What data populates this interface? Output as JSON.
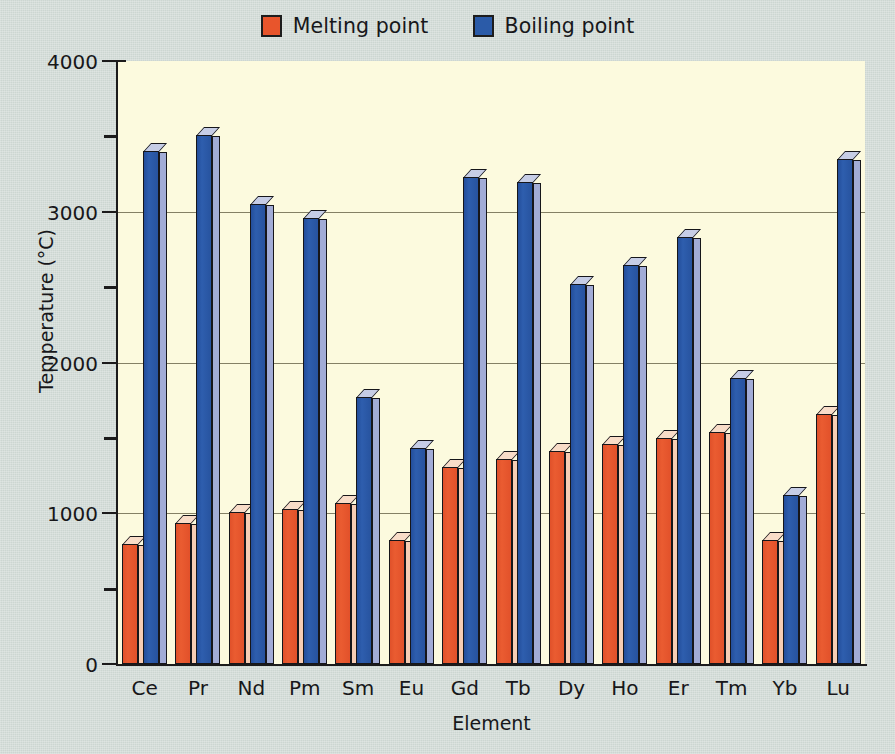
{
  "legend": {
    "entries": [
      {
        "label": "Melting point",
        "color": "#e8552c",
        "icon": "square-swatch-icon"
      },
      {
        "label": "Boiling point",
        "color": "#2b5ba8",
        "icon": "square-swatch-icon"
      }
    ]
  },
  "axes": {
    "ylabel": "Temperature (°C)",
    "xlabel": "Element",
    "ytick_labels": [
      "0",
      "1000",
      "2000",
      "3000",
      "4000"
    ],
    "yticks": [
      0,
      1000,
      2000,
      3000,
      4000
    ],
    "yminor": [
      500,
      1500,
      2500,
      3500
    ],
    "ymin": 0,
    "ymax": 4000
  },
  "colors": {
    "page_background": "#ccd6d1",
    "plot_background": "#fcfade",
    "melting_front": "#e8552c",
    "melting_side": "#f6cdb4",
    "boiling_front": "#2b5ba8",
    "boiling_side": "#a2acd6",
    "axis": "#1b1b1b",
    "gridline": "#6e6a50"
  },
  "chart_data": {
    "type": "bar",
    "title": "",
    "xlabel": "Element",
    "ylabel": "Temperature (°C)",
    "ylim": [
      0,
      4000
    ],
    "grid": true,
    "legend_position": "top-center",
    "categories": [
      "Ce",
      "Pr",
      "Nd",
      "Pm",
      "Sm",
      "Eu",
      "Gd",
      "Tb",
      "Dy",
      "Ho",
      "Er",
      "Tm",
      "Yb",
      "Lu"
    ],
    "series": [
      {
        "name": "Melting point",
        "color": "#e8552c",
        "values": [
          795,
          935,
          1010,
          1030,
          1070,
          820,
          1310,
          1360,
          1410,
          1460,
          1500,
          1540,
          820,
          1660
        ]
      },
      {
        "name": "Boiling point",
        "color": "#2b5ba8",
        "values": [
          3400,
          3510,
          3050,
          2960,
          1770,
          1430,
          3230,
          3200,
          2520,
          2650,
          2830,
          1900,
          1120,
          3350
        ]
      }
    ]
  }
}
